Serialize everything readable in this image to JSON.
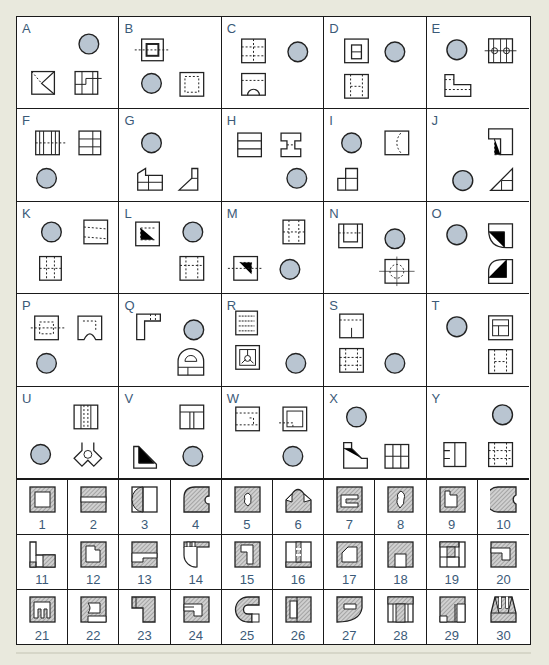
{
  "colors": {
    "background": "#e9e9dd",
    "sheet": "#ffffff",
    "line": "#1a1a1a",
    "label_text": "#3b5a78",
    "circle_fill": "#b9c5d1",
    "hatch": "#8a8a8a"
  },
  "letter_cells": [
    {
      "label": "A",
      "items": [
        "circle",
        "view",
        "view"
      ]
    },
    {
      "label": "B",
      "items": [
        "view",
        "circle",
        "view"
      ]
    },
    {
      "label": "C",
      "items": [
        "view",
        "view",
        "circle"
      ]
    },
    {
      "label": "D",
      "items": [
        "view",
        "circle",
        "view"
      ]
    },
    {
      "label": "E",
      "items": [
        "circle",
        "view",
        "view"
      ]
    },
    {
      "label": "F",
      "items": [
        "view",
        "view",
        "circle"
      ]
    },
    {
      "label": "G",
      "items": [
        "circle",
        "view",
        "view"
      ]
    },
    {
      "label": "H",
      "items": [
        "view",
        "view",
        "circle"
      ]
    },
    {
      "label": "I",
      "items": [
        "circle",
        "view",
        "view"
      ]
    },
    {
      "label": "J",
      "items": [
        "view",
        "circle",
        "view"
      ]
    },
    {
      "label": "K",
      "items": [
        "circle",
        "view",
        "view"
      ]
    },
    {
      "label": "L",
      "items": [
        "view",
        "circle",
        "view"
      ]
    },
    {
      "label": "M",
      "items": [
        "view",
        "view",
        "circle"
      ]
    },
    {
      "label": "N",
      "items": [
        "view",
        "circle",
        "view"
      ]
    },
    {
      "label": "O",
      "items": [
        "circle",
        "view",
        "view"
      ]
    },
    {
      "label": "P",
      "items": [
        "view",
        "view",
        "circle"
      ]
    },
    {
      "label": "Q",
      "items": [
        "view",
        "circle",
        "view"
      ]
    },
    {
      "label": "R",
      "items": [
        "view",
        "view",
        "circle"
      ]
    },
    {
      "label": "S",
      "items": [
        "view",
        "view",
        "circle"
      ]
    },
    {
      "label": "T",
      "items": [
        "circle",
        "view",
        "view"
      ]
    },
    {
      "label": "U",
      "items": [
        "view",
        "circle",
        "view"
      ]
    },
    {
      "label": "V",
      "items": [
        "view",
        "view",
        "circle"
      ]
    },
    {
      "label": "W",
      "items": [
        "view",
        "view",
        "circle"
      ]
    },
    {
      "label": "X",
      "items": [
        "circle",
        "view",
        "view"
      ]
    },
    {
      "label": "Y",
      "items": [
        "circle",
        "view",
        "view"
      ]
    }
  ],
  "number_cells": [
    "1",
    "2",
    "3",
    "4",
    "5",
    "6",
    "7",
    "8",
    "9",
    "10",
    "11",
    "12",
    "13",
    "14",
    "15",
    "16",
    "17",
    "18",
    "19",
    "20",
    "21",
    "22",
    "23",
    "24",
    "25",
    "26",
    "27",
    "28",
    "29",
    "30"
  ]
}
